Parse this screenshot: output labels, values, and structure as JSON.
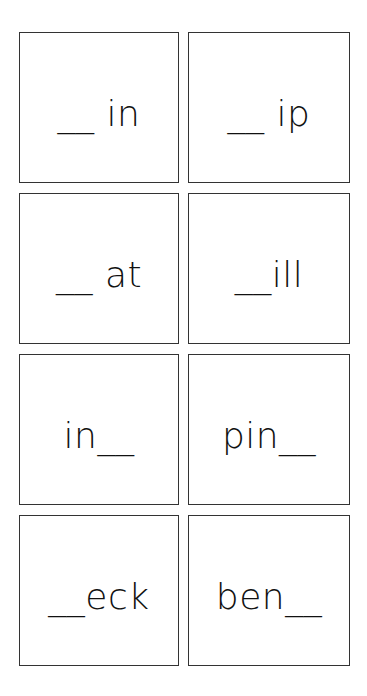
{
  "worksheet": {
    "cards": [
      {
        "text": "__ in"
      },
      {
        "text": "__ ip"
      },
      {
        "text": "__ at"
      },
      {
        "text": "__ill"
      },
      {
        "text": "in__"
      },
      {
        "text": "pin__"
      },
      {
        "text": "__eck"
      },
      {
        "text": "ben__"
      }
    ]
  }
}
